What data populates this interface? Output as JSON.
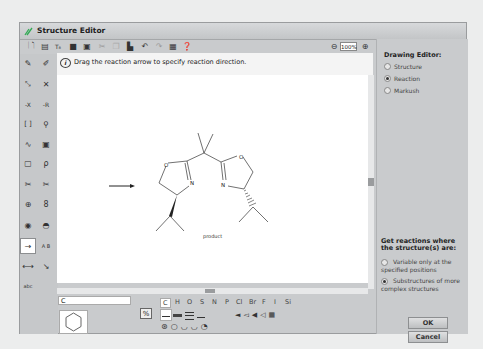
{
  "window": {
    "title": "Structure Editor"
  },
  "toolbar": {
    "buttons": [
      "new-icon",
      "open-icon",
      "text-format-icon",
      "save-icon",
      "save-as-icon",
      "cut-icon",
      "copy-icon",
      "paste-icon",
      "undo-icon",
      "redo-icon",
      "template-icon",
      "help-icon"
    ],
    "zoom_out": "zoom-out-icon",
    "zoom_level": "100%",
    "zoom_in": "zoom-in-icon"
  },
  "hint": {
    "text": "Drag the reaction arrow to specify reaction direction."
  },
  "left_tools": [
    {
      "name": "pencil-tool",
      "glyph": "✎"
    },
    {
      "name": "eraser-tool",
      "glyph": "✐"
    },
    {
      "name": "atom-map-tool",
      "glyph": "⤡"
    },
    {
      "name": "smart-tool",
      "glyph": "✕"
    },
    {
      "name": "x-group-tool",
      "glyph": "-X"
    },
    {
      "name": "r-group-tool",
      "glyph": "-R"
    },
    {
      "name": "bracket-tool",
      "glyph": "[ ]"
    },
    {
      "name": "query-tool",
      "glyph": "⚲"
    },
    {
      "name": "wavy-bond-tool",
      "glyph": "∿"
    },
    {
      "name": "template-tool",
      "glyph": "▣"
    },
    {
      "name": "rect-select-tool",
      "glyph": "▢"
    },
    {
      "name": "lasso-tool",
      "glyph": "ρ"
    },
    {
      "name": "bond-cut-tool",
      "glyph": "✂"
    },
    {
      "name": "scissors-tool",
      "glyph": "✂"
    },
    {
      "name": "charge-tool",
      "glyph": "⊕"
    },
    {
      "name": "radical-tool",
      "glyph": "8"
    },
    {
      "name": "ring-tool-1",
      "glyph": "◉"
    },
    {
      "name": "ring-tool-2",
      "glyph": "◓"
    },
    {
      "name": "reaction-arrow-tool",
      "glyph": "→",
      "selected": true
    },
    {
      "name": "ab-arrow-tool",
      "glyph": "A B"
    },
    {
      "name": "map-arrow-tool",
      "glyph": "⟷"
    },
    {
      "name": "bond-arrow-tool",
      "glyph": "↘"
    },
    {
      "name": "stereo-text-tool",
      "glyph": "abc"
    }
  ],
  "canvas": {
    "product_label": "product",
    "atoms": {
      "O_left": "O",
      "N_left": "N",
      "O_right": "O",
      "N_right": "N"
    }
  },
  "bottom": {
    "atom_input_value": "C",
    "toggle_label": "%",
    "elements": [
      "C",
      "H",
      "O",
      "S",
      "N",
      "P",
      "Cl",
      "Br",
      "F",
      "I",
      "Si"
    ],
    "selected_element": "C"
  },
  "right_panel": {
    "title": "Drawing Editor:",
    "modes": [
      {
        "label": "Structure",
        "selected": false
      },
      {
        "label": "Reaction",
        "selected": true
      },
      {
        "label": "Markush",
        "selected": false
      }
    ],
    "query_title": "Get reactions where the structure(s) are:",
    "query_options": [
      {
        "label": "Variable only at the specified positions",
        "selected": false
      },
      {
        "label": "Substructures of more complex structures",
        "selected": true
      }
    ],
    "ok_label": "OK",
    "cancel_label": "Cancel"
  }
}
